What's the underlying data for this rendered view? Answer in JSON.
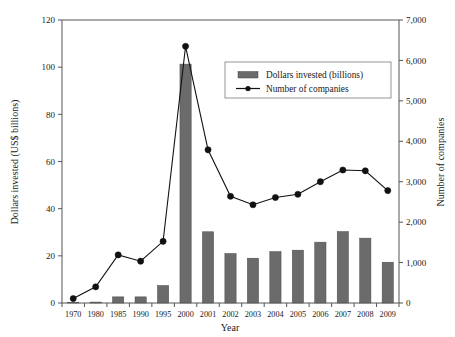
{
  "chart_data": {
    "type": "bar",
    "title": "",
    "subtitle": "",
    "xlabel": "Year",
    "ylabel": "Dollars invested (US$ billions)",
    "y2label": "Number of companies",
    "categories": [
      "1970",
      "1980",
      "1985",
      "1990",
      "1995",
      "2000",
      "2001",
      "2002",
      "2003",
      "2004",
      "2005",
      "2006",
      "2007",
      "2008",
      "2009"
    ],
    "grid": false,
    "legend_position": "upper-center",
    "ylim": [
      0,
      120
    ],
    "y2lim": [
      0,
      7000
    ],
    "yticks": [
      "0",
      "20",
      "40",
      "60",
      "80",
      "100",
      "120"
    ],
    "ytick_values": [
      0,
      20,
      40,
      60,
      80,
      100,
      120
    ],
    "y2ticks": [
      "0",
      "1,000",
      "2,000",
      "3,000",
      "4,000",
      "5,000",
      "6,000",
      "7,000"
    ],
    "y2tick_values": [
      0,
      1000,
      2000,
      3000,
      4000,
      5000,
      6000,
      7000
    ],
    "series": [
      {
        "name": "Dollars invested (billions)",
        "type": "bar",
        "axis": "left",
        "color": "#6b6b6b",
        "values": [
          0.1,
          0.4,
          2.6,
          2.6,
          7.4,
          101.3,
          30.2,
          21.0,
          19.0,
          21.8,
          22.4,
          25.8,
          30.3,
          27.5,
          17.3
        ]
      },
      {
        "name": "Number of companies",
        "type": "line",
        "axis": "right",
        "color": "#111111",
        "values": [
          110,
          400,
          1190,
          1035,
          1525,
          6350,
          3790,
          2640,
          2430,
          2610,
          2690,
          3000,
          3290,
          3270,
          2780
        ]
      }
    ]
  },
  "legend": {
    "items": [
      {
        "label": "Dollars invested (billions)",
        "marker": "bar-swatch"
      },
      {
        "label": "Number of companies",
        "marker": "line-marker"
      }
    ]
  }
}
